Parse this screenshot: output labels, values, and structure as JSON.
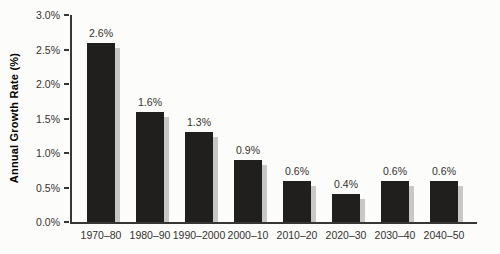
{
  "chart_data": {
    "type": "bar",
    "title": "",
    "xlabel": "",
    "ylabel": "Annual Growth Rate (%)",
    "categories": [
      "1970–80",
      "1980–90",
      "1990–2000",
      "2000–10",
      "2010–20",
      "2020–30",
      "2030–40",
      "2040–50"
    ],
    "values": [
      2.6,
      1.6,
      1.3,
      0.9,
      0.6,
      0.4,
      0.6,
      0.6
    ],
    "value_labels": [
      "2.6%",
      "1.6%",
      "1.3%",
      "0.9%",
      "0.6%",
      "0.4%",
      "0.6%",
      "0.6%"
    ],
    "ylim": [
      0,
      3.0
    ],
    "ytick_step": 0.5,
    "yticks": [
      {
        "value": 0.0,
        "label": "0.0%"
      },
      {
        "value": 0.5,
        "label": "0.5%"
      },
      {
        "value": 1.0,
        "label": "1.0%"
      },
      {
        "value": 1.5,
        "label": "1.5%"
      },
      {
        "value": 2.0,
        "label": "2.0%"
      },
      {
        "value": 2.5,
        "label": "2.5%"
      },
      {
        "value": 3.0,
        "label": "3.0%"
      }
    ],
    "grid": false,
    "legend": null,
    "colors": {
      "bar": "#211e1e",
      "bar_shadow": "#c7c7c5",
      "axis": "#383634",
      "text": "#343230",
      "background": "#fcfcfa"
    }
  }
}
